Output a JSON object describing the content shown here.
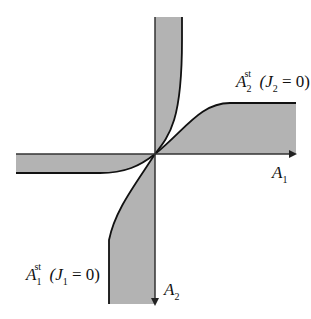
{
  "diagram": {
    "title": "",
    "colors": {
      "region_fill": "#b3b3b3",
      "curve": "#111111",
      "axis": "#333333",
      "background": "#ffffff"
    },
    "axes": {
      "horizontal": {
        "label_main": "A",
        "label_sub": "1",
        "direction": "right"
      },
      "vertical": {
        "label_main": "A",
        "label_sub": "2",
        "direction": "down"
      }
    },
    "curves": [
      {
        "name": "A2_st",
        "label_main": "A",
        "label_sub": "2",
        "label_sup": "st",
        "condition": "(J",
        "condition_sub": "2",
        "condition_rest": " = 0)"
      },
      {
        "name": "A1_st",
        "label_main": "A",
        "label_sub": "1",
        "label_sup": "st",
        "condition": "(J",
        "condition_sub": "1",
        "condition_rest": " = 0)"
      }
    ]
  }
}
